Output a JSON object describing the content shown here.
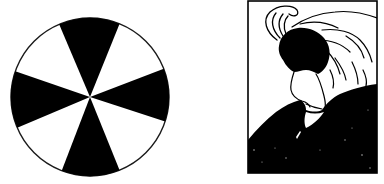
{
  "figures": [
    {
      "id": "wheel",
      "label": "Ambiguous figure-ground wheel",
      "colors": {
        "fill": "#000000",
        "background": "#ffffff",
        "outline": "#1a1a1a"
      },
      "circle": {
        "cx": 90,
        "cy": 97,
        "r": 79
      },
      "black_sectors": [
        {
          "start_deg": 339,
          "end_deg": 18
        },
        {
          "start_deg": 68,
          "end_deg": 111
        },
        {
          "start_deg": 157,
          "end_deg": 199
        },
        {
          "start_deg": 247,
          "end_deg": 292
        }
      ]
    },
    {
      "id": "portrait",
      "label": "My Wife and My Mother-in-Law illusion",
      "colors": {
        "ink": "#000000",
        "paper": "#ffffff"
      },
      "frame": {
        "x": 248,
        "y": 1,
        "width": 129,
        "height": 172
      }
    }
  ]
}
